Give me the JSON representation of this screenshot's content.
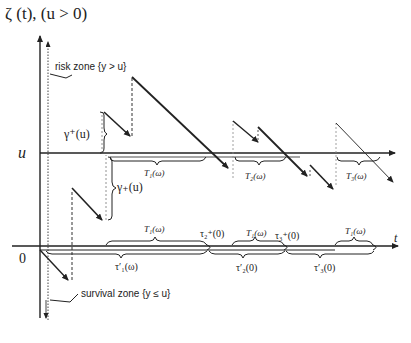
{
  "title": "ζ (t), (u > 0)",
  "axes": {
    "y_label": "ζ (t), (u > 0)",
    "x_label": "t",
    "origin_label": "0",
    "level_label": "u"
  },
  "zones": {
    "risk": "risk zone  {y > u}",
    "survival": "survival zone  {y ≤ u}"
  },
  "annotations": {
    "gamma_plus_upper": "γ⁺(u)",
    "gamma_plus_lower": "γ₊(u)",
    "T1_level": "T₁(ω)",
    "T2_level": "T₂(ω)",
    "T3_level": "T₃(ω)",
    "T1_axis_a": "T₁(ω)",
    "T1_axis_b": "T₁(ω)",
    "T1_axis_c": "T₁(ω)",
    "tau1_minus": "τ′₁(ω)",
    "tau2_plus": "τ₂⁺(0)",
    "tau2_minus": "τ′₂(0)",
    "tau3_plus": "τ₃⁺(0)",
    "tau3_minus": "τ′₃(0)"
  },
  "colors": {
    "line": "#222222",
    "dashed": "#555555",
    "light": "#888888",
    "background": "#ffffff"
  }
}
